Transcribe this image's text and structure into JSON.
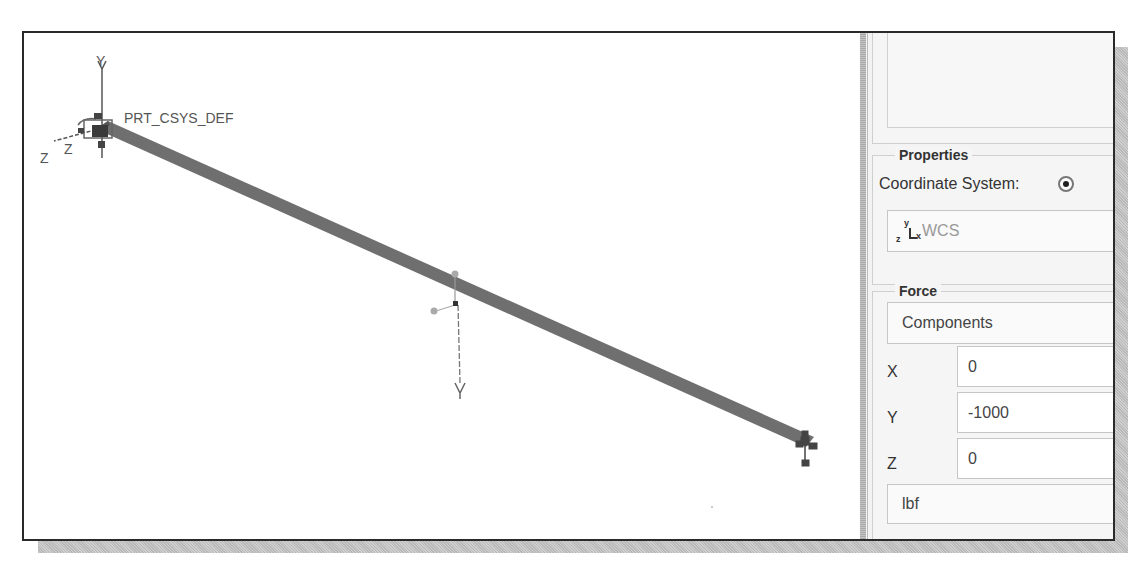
{
  "viewport": {
    "csys_label": "PRT_CSYS_DEF",
    "csys_label_overlap": "RBI",
    "axis_labels": {
      "y": "Y",
      "z_outer": "Z",
      "z_inner": "Z",
      "x": "X"
    },
    "beam_color": "#6f6f6f",
    "force_marker": "force-arrow-down"
  },
  "panel": {
    "references_list": [],
    "properties": {
      "title": "Properties",
      "coord_system_label": "Coordinate System:",
      "coord_system_option_selected": true,
      "csys_field": {
        "icon": "csys-icon",
        "axes": {
          "y": "y",
          "x": "x",
          "z": "z"
        },
        "value": "WCS"
      }
    },
    "force": {
      "title": "Force",
      "mode": "Components",
      "components": [
        {
          "axis": "X",
          "value": "0"
        },
        {
          "axis": "Y",
          "value": "-1000"
        },
        {
          "axis": "Z",
          "value": "0"
        }
      ],
      "units": "lbf"
    }
  }
}
